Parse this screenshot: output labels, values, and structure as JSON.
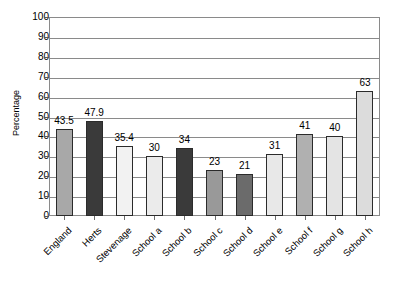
{
  "chart_data": {
    "type": "bar",
    "title": "",
    "subtitle": "",
    "xlabel": "",
    "ylabel": "Percentage",
    "ylim": [
      0,
      100
    ],
    "ytick_step": 10,
    "yticks": [
      0,
      10,
      20,
      30,
      40,
      50,
      60,
      70,
      80,
      90,
      100
    ],
    "grid": true,
    "legend": "none",
    "categories": [
      "England",
      "Herts",
      "Stevenage",
      "School a",
      "School b",
      "School c",
      "School d",
      "School e",
      "School f",
      "School g",
      "School h"
    ],
    "values": [
      43.5,
      47.9,
      35.4,
      30,
      34,
      23,
      21,
      31,
      41,
      40,
      63
    ],
    "value_labels": [
      "43.5",
      "47.9",
      "35.4",
      "30",
      "34",
      "23",
      "21",
      "31",
      "41",
      "40",
      "63"
    ],
    "bar_colors": [
      "#a8a8a8",
      "#3a3a3a",
      "#f2f2f2",
      "#ebebeb",
      "#3a3a3a",
      "#999999",
      "#6b6b6b",
      "#e8e8e8",
      "#b0b0b0",
      "#e4e4e4",
      "#dcdcdc"
    ],
    "bar_edge_color": "#2b2b2b",
    "axis_color": "#8a8a8a",
    "grid_color": "#8a8a8a",
    "background": "#ffffff",
    "xtick_label_rotation": -45
  }
}
